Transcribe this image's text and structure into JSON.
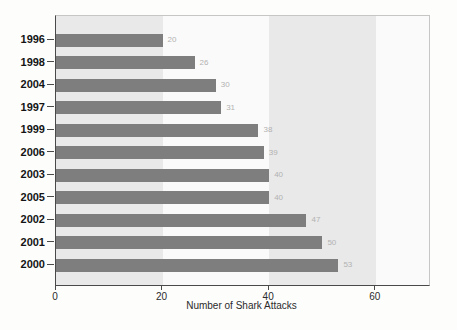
{
  "chart_data": {
    "type": "bar",
    "orientation": "horizontal",
    "title": "",
    "xlabel": "Number of Shark Attacks",
    "ylabel": "",
    "categories": [
      "1996",
      "1998",
      "2004",
      "1997",
      "1999",
      "2006",
      "2003",
      "2005",
      "2002",
      "2001",
      "2000"
    ],
    "values": [
      20,
      26,
      30,
      31,
      38,
      39,
      40,
      40,
      47,
      50,
      53
    ],
    "xlim": [
      0,
      70
    ],
    "xticks": [
      0,
      20,
      40,
      60
    ],
    "grid": false,
    "legend": false,
    "background_bands": [
      [
        0,
        20
      ],
      [
        40,
        60
      ]
    ],
    "colors": {
      "bar": "#7e7e7e",
      "band": "#e9e9e9",
      "plot_background": "#fafafa",
      "value_label": "#b2b2b2",
      "year_label": "#141414",
      "axis_text": "#2b2b2b",
      "axis_line": "#4a4a4a",
      "border": "#c6c6c6"
    }
  }
}
